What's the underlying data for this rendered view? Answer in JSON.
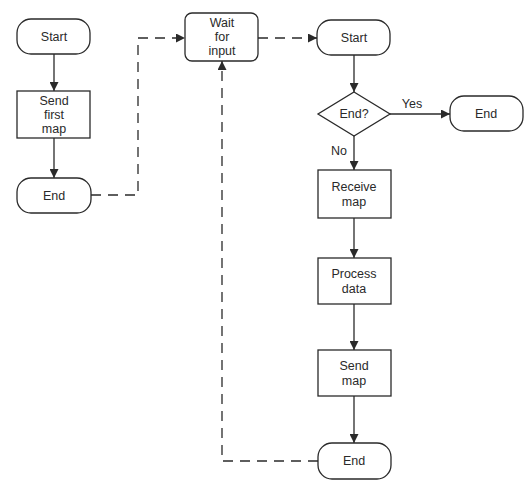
{
  "diagram": {
    "type": "flowchart",
    "colors": {
      "stroke": "#2a2a2a",
      "fill": "#ffffff",
      "background": "#ffffff"
    },
    "nodes": {
      "left_start": {
        "shape": "terminator",
        "label": "Start"
      },
      "send_first_map": {
        "shape": "process",
        "lines": [
          "Send",
          "first",
          "map"
        ]
      },
      "left_end": {
        "shape": "terminator",
        "label": "End"
      },
      "wait_for_input": {
        "shape": "rounded-process",
        "lines": [
          "Wait",
          "for",
          "input"
        ]
      },
      "right_start": {
        "shape": "terminator",
        "label": "Start"
      },
      "end_decision": {
        "shape": "decision",
        "label": "End?"
      },
      "yes_end": {
        "shape": "terminator",
        "label": "End"
      },
      "receive_map": {
        "shape": "process",
        "lines": [
          "Receive",
          "map"
        ]
      },
      "process_data": {
        "shape": "process",
        "lines": [
          "Process",
          "data"
        ]
      },
      "send_map": {
        "shape": "process",
        "lines": [
          "Send",
          "map"
        ]
      },
      "bottom_end": {
        "shape": "terminator",
        "label": "End"
      }
    },
    "edges": [
      {
        "from": "left_start",
        "to": "send_first_map",
        "style": "solid"
      },
      {
        "from": "send_first_map",
        "to": "left_end",
        "style": "solid"
      },
      {
        "from": "left_end",
        "to": "wait_for_input",
        "style": "dashed"
      },
      {
        "from": "wait_for_input",
        "to": "right_start",
        "style": "dashed"
      },
      {
        "from": "right_start",
        "to": "end_decision",
        "style": "solid"
      },
      {
        "from": "end_decision",
        "to": "yes_end",
        "style": "solid",
        "label": "Yes"
      },
      {
        "from": "end_decision",
        "to": "receive_map",
        "style": "solid",
        "label": "No"
      },
      {
        "from": "receive_map",
        "to": "process_data",
        "style": "solid"
      },
      {
        "from": "process_data",
        "to": "send_map",
        "style": "solid"
      },
      {
        "from": "send_map",
        "to": "bottom_end",
        "style": "solid"
      },
      {
        "from": "bottom_end",
        "to": "wait_for_input",
        "style": "dashed"
      }
    ],
    "edge_labels": {
      "yes": "Yes",
      "no": "No"
    }
  }
}
